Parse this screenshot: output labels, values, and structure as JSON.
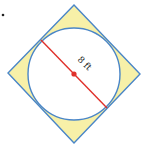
{
  "diagram": {
    "type": "circle inscribed in square (rotated 45°)",
    "bullet_marker": "•",
    "diameter_label": "8 ft",
    "colors": {
      "square_stroke": "#4a86c8",
      "circle_stroke": "#4a86c8",
      "corner_fill": "#f7f0a8",
      "diameter_line": "#e0312b",
      "center_dot": "#e0312b"
    }
  }
}
